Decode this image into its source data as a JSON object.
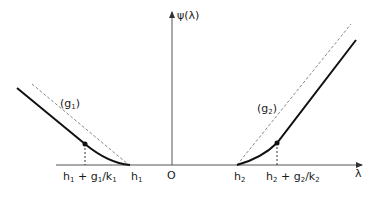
{
  "diagram": {
    "y_axis_label": "ψ(λ)",
    "x_axis_label": "λ",
    "origin_label": "O",
    "ticks": [
      {
        "id": "h1_plus",
        "main": "h",
        "sub1": "1",
        "mid": " + g",
        "sub2": "1",
        "tail": "/k",
        "sub3": "1"
      },
      {
        "id": "h1",
        "main": "h",
        "sub1": "1"
      },
      {
        "id": "h2",
        "main": "h",
        "sub1": "2"
      },
      {
        "id": "h2_plus",
        "main": "h",
        "sub1": "2",
        "mid": " + g",
        "sub2": "2",
        "tail": "/k",
        "sub3": "2"
      }
    ],
    "asymptotes": [
      {
        "label_open": "(g",
        "sub": "1",
        "label_close": ")"
      },
      {
        "label_open": "(g",
        "sub": "2",
        "label_close": ")"
      }
    ],
    "colors": {
      "curve": "#111111",
      "axis": "#555555",
      "dashed": "#888888"
    }
  }
}
